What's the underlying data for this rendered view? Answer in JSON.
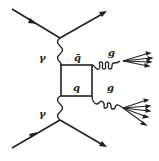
{
  "diagram": {
    "labels": {
      "photon_top": "γ",
      "photon_bottom": "γ",
      "antiquark": "q̄",
      "quark": "q",
      "gluon_top": "g",
      "gluon_bottom": "g"
    },
    "colors": {
      "line": "#222222",
      "background": "#ffffff"
    }
  }
}
